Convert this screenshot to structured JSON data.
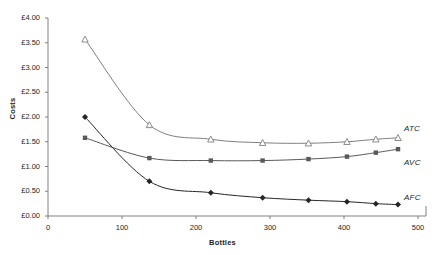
{
  "chart_data": {
    "type": "line",
    "title": "",
    "xlabel": "Bottles",
    "ylabel": "Costs",
    "xlim": [
      0,
      500
    ],
    "ylim": [
      0,
      4.0
    ],
    "grid": false,
    "legend_position": "right-inline",
    "x_ticks": [
      0,
      100,
      200,
      300,
      400,
      500
    ],
    "x_tick_labels": [
      "0",
      "100",
      "200",
      "300",
      "400",
      "500"
    ],
    "y_ticks": [
      0,
      0.5,
      1.0,
      1.5,
      2.0,
      2.5,
      3.0,
      3.5,
      4.0
    ],
    "y_tick_labels": [
      "£0.00",
      "£0.50",
      "£1.00",
      "£1.50",
      "£2.00",
      "£2.50",
      "£3.00",
      "£3.50",
      "£4.00"
    ],
    "x": [
      50,
      137,
      220,
      290,
      352,
      404,
      443,
      473
    ],
    "series": [
      {
        "name": "ATC",
        "label": "ATC",
        "marker": "open-triangle",
        "color": "#7f7f7f",
        "values": [
          3.57,
          1.84,
          1.55,
          1.48,
          1.47,
          1.5,
          1.55,
          1.58
        ]
      },
      {
        "name": "AVC",
        "label": "AVC",
        "marker": "filled-square",
        "color": "#595959",
        "values": [
          1.58,
          1.17,
          1.12,
          1.12,
          1.15,
          1.2,
          1.28,
          1.35
        ]
      },
      {
        "name": "AFC",
        "label": "AFC",
        "marker": "filled-diamond",
        "color": "#262626",
        "values": [
          2.0,
          0.7,
          0.47,
          0.37,
          0.32,
          0.29,
          0.25,
          0.23
        ]
      }
    ]
  },
  "axes": {
    "y_title": "Costs",
    "x_title": "Bottles"
  },
  "colors": {
    "axis": "#808080",
    "text": "#231f20",
    "atc": "#7f7f7f",
    "avc": "#595959",
    "afc": "#262626"
  }
}
